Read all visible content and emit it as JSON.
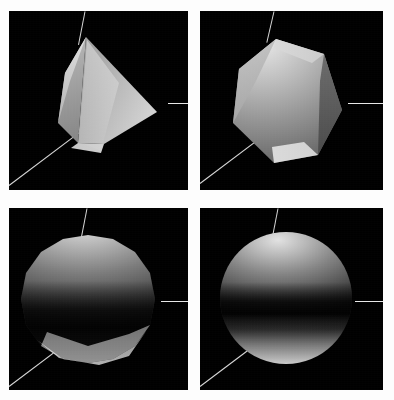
{
  "figure": {
    "background_color": "#fdfdfd",
    "panel_background": "#000000",
    "axis_color": "#d8d8d8",
    "grid": {
      "rows": 2,
      "cols": 2
    }
  },
  "panels": [
    {
      "id": "panel-top-left",
      "label": "Coarse tessellation",
      "shape": "low-poly cone",
      "facet_count": 4,
      "silhouette": "cone / pyramid",
      "shading": "flat faceted",
      "highlight_color": "#f2f2f2",
      "shadow_color": "#1a1a1a",
      "axes": [
        "vertical-axis",
        "horizontal-axis",
        "diagonal-axis"
      ]
    },
    {
      "id": "panel-top-right",
      "label": "Medium tessellation",
      "shape": "faceted polyhedron",
      "facet_count": 8,
      "silhouette": "heptagon",
      "shading": "flat faceted",
      "highlight_color": "#e6e6e6",
      "shadow_color": "#202020",
      "axes": [
        "vertical-axis",
        "horizontal-axis",
        "diagonal-axis"
      ]
    },
    {
      "id": "panel-bottom-left",
      "label": "Fine tessellation",
      "shape": "near sphere",
      "facet_count": 16,
      "silhouette": "hexadecagon",
      "shading": "smooth with equatorial shadow band",
      "highlight_color": "#d9d9d9",
      "shadow_color": "#070707",
      "axes": [
        "vertical-axis",
        "horizontal-axis",
        "diagonal-axis"
      ]
    },
    {
      "id": "panel-bottom-right",
      "label": "Smooth sphere",
      "shape": "sphere",
      "facet_count": 64,
      "silhouette": "circle",
      "shading": "smooth with equatorial shadow band",
      "highlight_color": "#dcdcdc",
      "shadow_color": "#050505",
      "axes": [
        "vertical-axis",
        "horizontal-axis",
        "diagonal-axis"
      ]
    }
  ]
}
